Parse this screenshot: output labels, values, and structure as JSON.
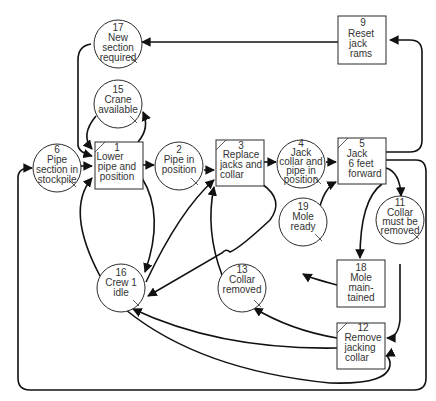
{
  "diagram": {
    "type": "petri-net activity cycle",
    "nodes": [
      {
        "id": "17",
        "shape": "circle",
        "lines": [
          "17",
          "New",
          "section",
          "required"
        ]
      },
      {
        "id": "9",
        "shape": "box",
        "lines": [
          "9",
          "Reset",
          "jack",
          "rams"
        ]
      },
      {
        "id": "15",
        "shape": "circle",
        "lines": [
          "15",
          "Crane",
          "available"
        ]
      },
      {
        "id": "6",
        "shape": "circle",
        "lines": [
          "6",
          "Pipe",
          "section in",
          "stockpile"
        ]
      },
      {
        "id": "1",
        "shape": "box",
        "lines": [
          "1",
          "Lower",
          "pipe and",
          "position"
        ]
      },
      {
        "id": "2",
        "shape": "circle",
        "lines": [
          "2",
          "Pipe in",
          "position"
        ]
      },
      {
        "id": "3",
        "shape": "box",
        "lines": [
          "3",
          "Replace",
          "jacks and",
          "collar"
        ]
      },
      {
        "id": "4",
        "shape": "circle",
        "lines": [
          "4",
          "Jack",
          "collar and",
          "pipe in",
          "position"
        ]
      },
      {
        "id": "5",
        "shape": "box",
        "lines": [
          "5",
          "Jack",
          "6 feet",
          "forward"
        ]
      },
      {
        "id": "19",
        "shape": "circle",
        "lines": [
          "19",
          "Mole",
          "ready"
        ]
      },
      {
        "id": "11",
        "shape": "circle",
        "lines": [
          "11",
          "Collar",
          "must be",
          "removed"
        ]
      },
      {
        "id": "16",
        "shape": "circle",
        "lines": [
          "16",
          "Crew 1",
          "idle"
        ]
      },
      {
        "id": "13",
        "shape": "circle",
        "lines": [
          "13",
          "Collar",
          "removed"
        ]
      },
      {
        "id": "18",
        "shape": "box",
        "lines": [
          "18",
          "Mole",
          "main-",
          "tained"
        ]
      },
      {
        "id": "12",
        "shape": "box",
        "lines": [
          "12",
          "Remove",
          "jacking",
          "collar"
        ]
      }
    ],
    "edges": [
      [
        "17",
        "1"
      ],
      [
        "9",
        "17"
      ],
      [
        "15",
        "1"
      ],
      [
        "1",
        "15"
      ],
      [
        "6",
        "1"
      ],
      [
        "1",
        "2"
      ],
      [
        "2",
        "3"
      ],
      [
        "3",
        "4"
      ],
      [
        "4",
        "5"
      ],
      [
        "5",
        "9"
      ],
      [
        "5",
        "11"
      ],
      [
        "5",
        "18"
      ],
      [
        "5",
        "6"
      ],
      [
        "19",
        "5"
      ],
      [
        "18",
        "19"
      ],
      [
        "11",
        "12"
      ],
      [
        "12",
        "13"
      ],
      [
        "12",
        "16"
      ],
      [
        "13",
        "3"
      ],
      [
        "16",
        "1"
      ],
      [
        "16",
        "3"
      ],
      [
        "1",
        "16"
      ],
      [
        "3",
        "16"
      ],
      [
        "16",
        "12"
      ]
    ],
    "colors": {
      "line": "#111111",
      "shape_fill": "#ffffff",
      "text": "#333333"
    }
  }
}
